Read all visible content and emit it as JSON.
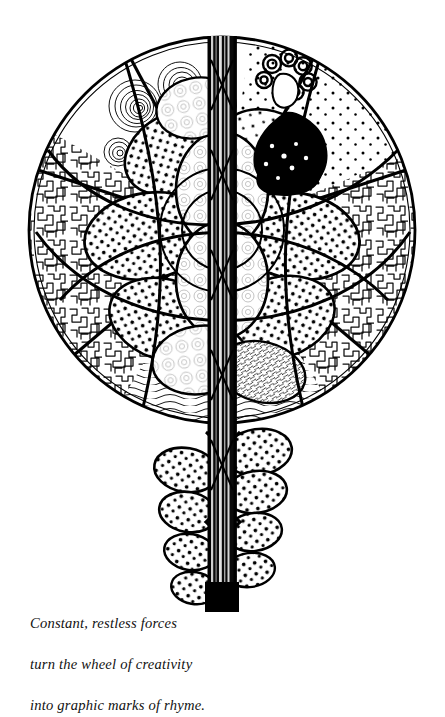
{
  "artwork": {
    "title": "wheel-of-creativity-pen-and-ink-drawing",
    "medium": "pen-and-ink line drawing",
    "background_color": "#ffffff",
    "ink_color": "#000000",
    "composition": {
      "wheel": {
        "name": "circular mandala wheel",
        "center_x": 222,
        "center_y": 230,
        "radius": 194,
        "outline_width": 2.6
      },
      "stem": {
        "name": "vertical striated stem",
        "x": 222,
        "top_y": 36,
        "bottom_y": 612,
        "width": 26,
        "description": "dark vertical band with pale vertical striations running from the top of the wheel down through the tail, ending in a solid black block"
      },
      "figure": {
        "name": "seated figure with curly hair",
        "x": 287,
        "y": 95,
        "description": "small stylized figure with coiled curly hair and a dense black flowing garment in the upper right sector"
      },
      "tail": {
        "name": "descending lobed tail",
        "from_y": 430,
        "to_y": 600,
        "lobe_count": 8,
        "description": "alternating stippled oval lobes stepping down the left and right of the stem"
      }
    },
    "textures": [
      {
        "id": "maze",
        "label": "maze squiggle texture",
        "where": "left and right outer sectors"
      },
      {
        "id": "stipple",
        "label": "stippled dot texture",
        "where": "petal lobes and upper sectors"
      },
      {
        "id": "spiral",
        "label": "concentric spiral rings",
        "where": "upper left sector"
      },
      {
        "id": "waves",
        "label": "flowing parallel wave hatching",
        "where": "lower sector"
      },
      {
        "id": "hatch",
        "label": "fine cross hatching",
        "where": "lower right petal"
      }
    ],
    "petals": [
      {
        "cx": 176,
        "cy": 150,
        "rx": 52,
        "ry": 38,
        "rot": -28,
        "fill": "stipple"
      },
      {
        "cx": 268,
        "cy": 150,
        "rx": 52,
        "ry": 38,
        "rot": 28,
        "fill": "stipple"
      },
      {
        "cx": 150,
        "cy": 232,
        "rx": 62,
        "ry": 42,
        "rot": -8,
        "fill": "stipple"
      },
      {
        "cx": 292,
        "cy": 232,
        "rx": 62,
        "ry": 42,
        "rot": 8,
        "fill": "stipple"
      },
      {
        "cx": 168,
        "cy": 316,
        "rx": 56,
        "ry": 40,
        "rot": 20,
        "fill": "stipple"
      },
      {
        "cx": 276,
        "cy": 316,
        "rx": 56,
        "ry": 40,
        "rot": -20,
        "fill": "stipple"
      },
      {
        "cx": 222,
        "cy": 272,
        "rx": 44,
        "ry": 54,
        "rot": 0,
        "fill": "light"
      },
      {
        "cx": 222,
        "cy": 186,
        "rx": 44,
        "ry": 54,
        "rot": 0,
        "fill": "light"
      }
    ],
    "spokes": [
      {
        "angle": -118,
        "label": "upper-left divider"
      },
      {
        "angle": -62,
        "label": "upper-right divider"
      },
      {
        "angle": -18,
        "label": "right divider"
      },
      {
        "angle": 40,
        "label": "lower-right divider"
      },
      {
        "angle": 140,
        "label": "lower-left divider"
      },
      {
        "angle": -162,
        "label": "left divider"
      }
    ]
  },
  "caption": {
    "name": "poem-caption",
    "lines": [
      "Constant, restless forces",
      "turn the wheel of creativity",
      "into graphic marks of rhyme."
    ],
    "full_text": "Constant, restless forces\nturn the wheel of creativity\ninto graphic marks of rhyme."
  }
}
